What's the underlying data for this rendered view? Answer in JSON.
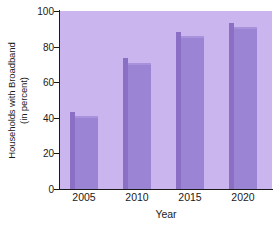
{
  "chart_data": {
    "type": "bar",
    "title": "",
    "categories": [
      "2005",
      "2010",
      "2015",
      "2020"
    ],
    "values": [
      41,
      71,
      86,
      91
    ],
    "xlabel": "Year",
    "ylabel": "Households with Broadband (in percent)",
    "ylabel_lines": [
      "Households with Broadband",
      "(in percent)"
    ],
    "ylim": [
      0,
      100
    ],
    "yticks": [
      0,
      20,
      40,
      60,
      80,
      100
    ],
    "ytick_labels": [
      "0",
      "20",
      "40",
      "60",
      "80",
      "100"
    ],
    "grid": false,
    "legend": null,
    "colors": {
      "bar_fill": "#9b84d4",
      "bar_shade": "#8a6fc4",
      "plot_background": "#cbb5ee",
      "page_background": "#ffffff",
      "axis": "#1a1a1a",
      "text": "#1a1a1a"
    }
  }
}
